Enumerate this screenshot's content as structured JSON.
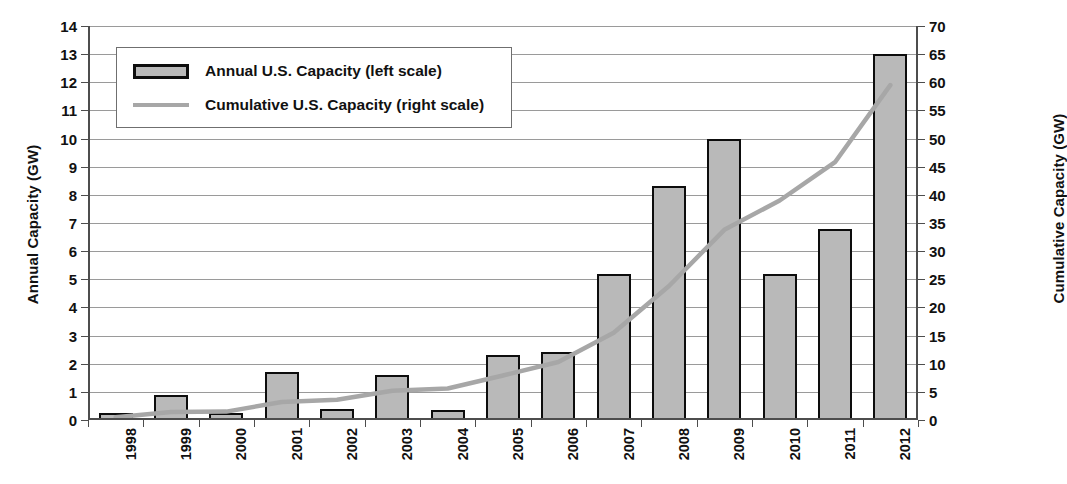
{
  "chart_data": {
    "type": "bar",
    "title": "",
    "xlabel": "",
    "ylabel": "Annual Capacity (GW)",
    "y2label": "Cumulative Capacity (GW)",
    "categories": [
      "1998",
      "1999",
      "2000",
      "2001",
      "2002",
      "2003",
      "2004",
      "2005",
      "2006",
      "2007",
      "2008",
      "2009",
      "2010",
      "2011",
      "2012"
    ],
    "ylim": [
      0,
      14
    ],
    "y2lim": [
      0,
      70
    ],
    "yticks": [
      0,
      1,
      2,
      3,
      4,
      5,
      6,
      7,
      8,
      9,
      10,
      11,
      12,
      13,
      14
    ],
    "y2ticks": [
      0,
      5,
      10,
      15,
      20,
      25,
      30,
      35,
      40,
      45,
      50,
      55,
      60,
      65,
      70
    ],
    "grid": true,
    "legend_position": "upper-left",
    "series": [
      {
        "name": "Annual U.S. Capacity (left scale)",
        "type": "bar",
        "axis": "left",
        "color": "#b9b9b9",
        "edge_color": "#0d0d0d",
        "values": [
          0.1,
          0.9,
          0.05,
          1.7,
          0.4,
          1.6,
          0.35,
          2.3,
          2.4,
          5.2,
          8.3,
          10.0,
          5.2,
          6.8,
          13.0
        ]
      },
      {
        "name": "Cumulative U.S. Capacity (right scale)",
        "type": "line",
        "axis": "right",
        "color": "#a7a7a7",
        "values": [
          0.5,
          1.4,
          1.5,
          3.2,
          3.6,
          5.2,
          5.6,
          7.9,
          10.3,
          15.5,
          23.8,
          33.8,
          39.0,
          45.8,
          59.5
        ]
      }
    ]
  },
  "legend": {
    "items": [
      {
        "label": "Annual U.S. Capacity (left scale)",
        "marker": "bar-swatch"
      },
      {
        "label": "Cumulative U.S. Capacity (right scale)",
        "marker": "line-swatch"
      }
    ]
  },
  "colors": {
    "bar_fill": "#b9b9b9",
    "bar_edge": "#0d0d0d",
    "line": "#a7a7a7",
    "grid": "#9a9a9a",
    "axis": "#4d4d4d",
    "text": "#111111",
    "background": "#ffffff"
  }
}
